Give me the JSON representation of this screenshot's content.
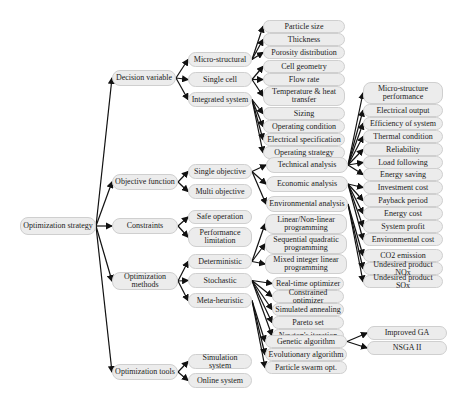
{
  "title": "Optimization strategy",
  "root": {
    "id": "root",
    "label": "Optimization strategy"
  },
  "nodes": [
    {
      "id": "root",
      "label": "Optimization strategy",
      "x": 20,
      "y": 217,
      "w": 76,
      "h": 18
    },
    {
      "id": "dv",
      "label": "Decision variable",
      "x": 112,
      "y": 70,
      "w": 64,
      "h": 16
    },
    {
      "id": "of",
      "label": "Objective function",
      "x": 112,
      "y": 174,
      "w": 66,
      "h": 16
    },
    {
      "id": "co",
      "label": "Constraints",
      "x": 112,
      "y": 218,
      "w": 66,
      "h": 16
    },
    {
      "id": "om",
      "label": "Optimization methods",
      "x": 112,
      "y": 272,
      "w": 66,
      "h": 18
    },
    {
      "id": "ot",
      "label": "Optimization tools",
      "x": 112,
      "y": 364,
      "w": 66,
      "h": 16
    },
    {
      "id": "ms",
      "label": "Micro-structural",
      "x": 188,
      "y": 52,
      "w": 64,
      "h": 15
    },
    {
      "id": "sc",
      "label": "Single cell",
      "x": 188,
      "y": 72,
      "w": 64,
      "h": 15
    },
    {
      "id": "is",
      "label": "Integrated system",
      "x": 188,
      "y": 92,
      "w": 64,
      "h": 15
    },
    {
      "id": "ps",
      "label": "Particle size",
      "x": 263,
      "y": 20,
      "w": 82,
      "h": 13
    },
    {
      "id": "th",
      "label": "Thickness",
      "x": 263,
      "y": 33,
      "w": 82,
      "h": 13
    },
    {
      "id": "pd",
      "label": "Porosity distribution",
      "x": 263,
      "y": 46,
      "w": 82,
      "h": 13
    },
    {
      "id": "cg",
      "label": "Cell geometry",
      "x": 263,
      "y": 60,
      "w": 82,
      "h": 13
    },
    {
      "id": "fr",
      "label": "Flow rate",
      "x": 263,
      "y": 73,
      "w": 82,
      "h": 13
    },
    {
      "id": "th2",
      "label": "Temperature & heat transfer",
      "x": 263,
      "y": 86,
      "w": 82,
      "h": 20
    },
    {
      "id": "sz",
      "label": "Sizing",
      "x": 263,
      "y": 107,
      "w": 82,
      "h": 13
    },
    {
      "id": "oc",
      "label": "Operating condition",
      "x": 263,
      "y": 120,
      "w": 82,
      "h": 13
    },
    {
      "id": "es",
      "label": "Electrical specification",
      "x": 263,
      "y": 133,
      "w": 82,
      "h": 13
    },
    {
      "id": "os",
      "label": "Operating strategy",
      "x": 263,
      "y": 146,
      "w": 82,
      "h": 13
    },
    {
      "id": "so",
      "label": "Single objective",
      "x": 188,
      "y": 164,
      "w": 64,
      "h": 15
    },
    {
      "id": "mo",
      "label": "Multi objective",
      "x": 188,
      "y": 184,
      "w": 64,
      "h": 15
    },
    {
      "id": "sfo",
      "label": "Safe operation",
      "x": 188,
      "y": 210,
      "w": 64,
      "h": 14
    },
    {
      "id": "pl",
      "label": "Performance limitation",
      "x": 188,
      "y": 227,
      "w": 64,
      "h": 20
    },
    {
      "id": "de",
      "label": "Deterministic",
      "x": 188,
      "y": 254,
      "w": 64,
      "h": 15
    },
    {
      "id": "st",
      "label": "Stochastic",
      "x": 188,
      "y": 273,
      "w": 64,
      "h": 15
    },
    {
      "id": "mh",
      "label": "Meta-heuristic",
      "x": 188,
      "y": 293,
      "w": 64,
      "h": 15
    },
    {
      "id": "ss",
      "label": "Simulation system",
      "x": 188,
      "y": 354,
      "w": 64,
      "h": 15
    },
    {
      "id": "ons",
      "label": "Online system",
      "x": 188,
      "y": 373,
      "w": 64,
      "h": 15
    },
    {
      "id": "ta",
      "label": "Technical analysis",
      "x": 266,
      "y": 157,
      "w": 82,
      "h": 16
    },
    {
      "id": "ea",
      "label": "Economic analysis",
      "x": 266,
      "y": 176,
      "w": 82,
      "h": 16
    },
    {
      "id": "ena",
      "label": "Environmental analysis",
      "x": 266,
      "y": 196,
      "w": 82,
      "h": 16
    },
    {
      "id": "lnp",
      "label": "Linear/Non-linear programming",
      "x": 265,
      "y": 214,
      "w": 82,
      "h": 20
    },
    {
      "id": "sqp",
      "label": "Sequential quadratic programming",
      "x": 265,
      "y": 234,
      "w": 82,
      "h": 20
    },
    {
      "id": "mil",
      "label": "Mixed integer linear programming",
      "x": 265,
      "y": 254,
      "w": 82,
      "h": 20
    },
    {
      "id": "rto",
      "label": "Real-time optimizer",
      "x": 272,
      "y": 277,
      "w": 72,
      "h": 13
    },
    {
      "id": "cop",
      "label": "Constrained optimizer",
      "x": 272,
      "y": 290,
      "w": 72,
      "h": 13
    },
    {
      "id": "sa",
      "label": "Simulated annealing",
      "x": 272,
      "y": 303,
      "w": 72,
      "h": 13
    },
    {
      "id": "pset",
      "label": "Pareto set",
      "x": 272,
      "y": 316,
      "w": 72,
      "h": 13
    },
    {
      "id": "ni",
      "label": "Newton's iteration",
      "x": 272,
      "y": 329,
      "w": 72,
      "h": 13
    },
    {
      "id": "ga",
      "label": "Genetic algorithm",
      "x": 265,
      "y": 335,
      "w": 82,
      "h": 13
    },
    {
      "id": "eva",
      "label": "Evolutionary algorithm",
      "x": 265,
      "y": 348,
      "w": 82,
      "h": 13
    },
    {
      "id": "pso",
      "label": "Particle swarm opt.",
      "x": 265,
      "y": 361,
      "w": 82,
      "h": 13
    },
    {
      "id": "igA",
      "label": "Improved GA",
      "x": 367,
      "y": 326,
      "w": 80,
      "h": 14
    },
    {
      "id": "nsga",
      "label": "NSGA II",
      "x": 367,
      "y": 341,
      "w": 80,
      "h": 14
    },
    {
      "id": "msp",
      "label": "Micro-structure performance",
      "x": 363,
      "y": 82,
      "w": 80,
      "h": 22
    },
    {
      "id": "eo",
      "label": "Electrical output",
      "x": 363,
      "y": 104,
      "w": 80,
      "h": 13
    },
    {
      "id": "eos",
      "label": "Efficiency of system",
      "x": 363,
      "y": 117,
      "w": 80,
      "h": 13
    },
    {
      "id": "tc",
      "label": "Thermal condition",
      "x": 363,
      "y": 130,
      "w": 80,
      "h": 13
    },
    {
      "id": "rel",
      "label": "Reliability",
      "x": 363,
      "y": 143,
      "w": 80,
      "h": 13
    },
    {
      "id": "lf",
      "label": "Load following",
      "x": 363,
      "y": 156,
      "w": 80,
      "h": 13
    },
    {
      "id": "esv",
      "label": "Energy saving",
      "x": 363,
      "y": 168,
      "w": 80,
      "h": 13
    },
    {
      "id": "ic",
      "label": "Investment cost",
      "x": 363,
      "y": 181,
      "w": 80,
      "h": 13
    },
    {
      "id": "pp",
      "label": "Payback period",
      "x": 363,
      "y": 194,
      "w": 80,
      "h": 13
    },
    {
      "id": "ec",
      "label": "Energy cost",
      "x": 363,
      "y": 207,
      "w": 80,
      "h": 13
    },
    {
      "id": "sp",
      "label": "System profit",
      "x": 363,
      "y": 220,
      "w": 80,
      "h": 13
    },
    {
      "id": "enc",
      "label": "Environmental cost",
      "x": 363,
      "y": 233,
      "w": 80,
      "h": 13
    },
    {
      "id": "co2",
      "label": "CO2 emission",
      "x": 363,
      "y": 249,
      "w": 80,
      "h": 13
    },
    {
      "id": "nox",
      "label": "Undesired product NOx",
      "x": 363,
      "y": 262,
      "w": 80,
      "h": 13
    },
    {
      "id": "sox",
      "label": "Undesired product SOx",
      "x": 363,
      "y": 275,
      "w": 80,
      "h": 13
    }
  ],
  "edges": [
    [
      "root",
      "dv"
    ],
    [
      "root",
      "of"
    ],
    [
      "root",
      "co"
    ],
    [
      "root",
      "om"
    ],
    [
      "root",
      "ot"
    ],
    [
      "dv",
      "ms"
    ],
    [
      "dv",
      "sc"
    ],
    [
      "dv",
      "is"
    ],
    [
      "ms",
      "ps"
    ],
    [
      "ms",
      "th"
    ],
    [
      "ms",
      "pd"
    ],
    [
      "sc",
      "cg"
    ],
    [
      "sc",
      "fr"
    ],
    [
      "sc",
      "th2"
    ],
    [
      "is",
      "sz"
    ],
    [
      "is",
      "oc"
    ],
    [
      "is",
      "es"
    ],
    [
      "is",
      "os"
    ],
    [
      "of",
      "so"
    ],
    [
      "of",
      "mo"
    ],
    [
      "so",
      "ta"
    ],
    [
      "so",
      "ea"
    ],
    [
      "so",
      "ena"
    ],
    [
      "ta",
      "msp"
    ],
    [
      "ta",
      "eo"
    ],
    [
      "ta",
      "eos"
    ],
    [
      "ta",
      "tc"
    ],
    [
      "ta",
      "rel"
    ],
    [
      "ta",
      "lf"
    ],
    [
      "ta",
      "esv"
    ],
    [
      "ea",
      "ic"
    ],
    [
      "ea",
      "pp"
    ],
    [
      "ea",
      "ec"
    ],
    [
      "ea",
      "sp"
    ],
    [
      "ea",
      "enc"
    ],
    [
      "ena",
      "co2"
    ],
    [
      "ena",
      "nox"
    ],
    [
      "ena",
      "sox"
    ],
    [
      "co",
      "sfo"
    ],
    [
      "co",
      "pl"
    ],
    [
      "om",
      "de"
    ],
    [
      "om",
      "st"
    ],
    [
      "om",
      "mh"
    ],
    [
      "de",
      "lnp"
    ],
    [
      "de",
      "sqp"
    ],
    [
      "de",
      "mil"
    ],
    [
      "st",
      "rto"
    ],
    [
      "st",
      "cop"
    ],
    [
      "st",
      "sa"
    ],
    [
      "st",
      "pset"
    ],
    [
      "st",
      "ni"
    ],
    [
      "mh",
      "ga"
    ],
    [
      "mh",
      "eva"
    ],
    [
      "mh",
      "pso"
    ],
    [
      "ga",
      "igA"
    ],
    [
      "ga",
      "nsga"
    ],
    [
      "ot",
      "ss"
    ],
    [
      "ot",
      "ons"
    ]
  ],
  "colors": {
    "node_fill": "#ececec",
    "node_border": "#cfcfcf",
    "edge": "#111111",
    "text": "#222222"
  }
}
